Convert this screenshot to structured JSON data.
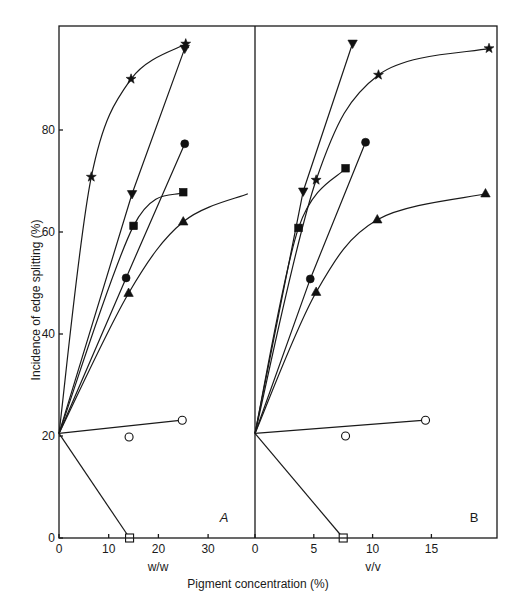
{
  "chart_data": [
    {
      "type": "line",
      "panel": "A",
      "xlabel": "w/w",
      "ylabel": "Incidence of edge splitting (%)",
      "shared_xlabel": "Pigment concentration (%)",
      "xticks": [
        0,
        10,
        20,
        30
      ],
      "yticks": [
        0,
        20,
        40,
        60,
        80
      ],
      "xlim": [
        0,
        38
      ],
      "ylim": [
        0,
        100
      ],
      "origin": [
        0,
        20.5
      ],
      "series": [
        {
          "marker": "star",
          "points": [
            [
              0,
              20.5
            ],
            [
              6.5,
              70.8
            ],
            [
              14.5,
              90
            ],
            [
              25.5,
              96.9
            ]
          ],
          "curve": "smooth"
        },
        {
          "marker": "triangle-down",
          "points": [
            [
              0,
              20.5
            ],
            [
              14.7,
              67.5
            ],
            [
              25.3,
              96
            ]
          ],
          "curve": "straight"
        },
        {
          "marker": "circle-filled",
          "points": [
            [
              0,
              20.5
            ],
            [
              13.5,
              51
            ],
            [
              25.3,
              77.3
            ]
          ],
          "curve": "straight"
        },
        {
          "marker": "square-filled",
          "points": [
            [
              0,
              20.5
            ],
            [
              15,
              61.2
            ],
            [
              25,
              67.8
            ]
          ],
          "curve": "smooth"
        },
        {
          "marker": "triangle-up",
          "points": [
            [
              0,
              20.5
            ],
            [
              14,
              48
            ],
            [
              25,
              62
            ],
            [
              38,
              67.5
            ]
          ],
          "curve": "smooth"
        },
        {
          "marker": "circle-open",
          "points": [
            [
              0,
              20.5
            ],
            [
              14.1,
              19.8
            ],
            [
              24.8,
              23.1
            ]
          ],
          "curve": "fit",
          "fit_line": [
            [
              0,
              20.5
            ],
            [
              24.8,
              23.1
            ]
          ]
        },
        {
          "marker": "square-open",
          "points": [
            [
              0,
              20.5
            ],
            [
              14.2,
              0
            ]
          ],
          "curve": "smooth"
        }
      ]
    },
    {
      "type": "line",
      "panel": "B",
      "xlabel": "v/v",
      "ylabel": "Incidence of edge splitting (%)",
      "shared_xlabel": "Pigment concentration (%)",
      "xticks": [
        0,
        5,
        10,
        15
      ],
      "yticks": [
        0,
        20,
        40,
        60,
        80
      ],
      "xlim": [
        0,
        20.5
      ],
      "ylim": [
        0,
        100
      ],
      "origin": [
        0,
        20.5
      ],
      "series": [
        {
          "marker": "star",
          "points": [
            [
              0,
              20.5
            ],
            [
              5.2,
              70.2
            ],
            [
              10.5,
              90.8
            ],
            [
              19.9,
              96
            ]
          ],
          "curve": "smooth"
        },
        {
          "marker": "triangle-down",
          "points": [
            [
              0,
              20.5
            ],
            [
              4.1,
              68
            ],
            [
              8.3,
              97
            ]
          ],
          "curve": "straight"
        },
        {
          "marker": "circle-filled",
          "points": [
            [
              0,
              20.5
            ],
            [
              4.7,
              50.8
            ],
            [
              9.4,
              77.6
            ]
          ],
          "curve": "straight"
        },
        {
          "marker": "square-filled",
          "points": [
            [
              0,
              20.5
            ],
            [
              3.7,
              60.8
            ],
            [
              7.7,
              72.5
            ]
          ],
          "curve": "smooth"
        },
        {
          "marker": "triangle-up",
          "points": [
            [
              0,
              20.5
            ],
            [
              5.2,
              48.2
            ],
            [
              10.4,
              62.4
            ],
            [
              19.6,
              67.5
            ]
          ],
          "curve": "smooth"
        },
        {
          "marker": "circle-open",
          "points": [
            [
              0,
              20.5
            ],
            [
              7.7,
              20
            ],
            [
              14.5,
              23.1
            ]
          ],
          "curve": "fit",
          "fit_line": [
            [
              0,
              20.5
            ],
            [
              14.5,
              23.1
            ]
          ]
        },
        {
          "marker": "square-open",
          "points": [
            [
              0,
              20.5
            ],
            [
              7.5,
              0
            ]
          ],
          "curve": "smooth"
        }
      ]
    }
  ],
  "labels": {
    "y_axis_title": "Incidence of edge splitting (%)",
    "x_axis_title": "Pigment concentration (%)",
    "panel_a_unit": "w/w",
    "panel_b_unit": "v/v",
    "panel_a_letter": "A",
    "panel_b_letter": "B"
  }
}
